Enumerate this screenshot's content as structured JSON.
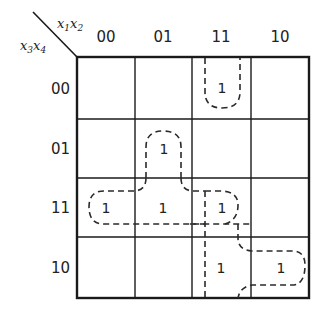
{
  "kmap": {
    "col_var": {
      "base": "x",
      "sub1": "1",
      "sub2": "2"
    },
    "row_var": {
      "base": "x",
      "sub1": "3",
      "sub2": "4"
    },
    "col_labels": [
      "00",
      "01",
      "11",
      "10"
    ],
    "row_labels": [
      "00",
      "01",
      "11",
      "10"
    ],
    "cells": [
      [
        "",
        "",
        "1",
        ""
      ],
      [
        "",
        "1",
        "",
        ""
      ],
      [
        "1",
        "1",
        "1",
        ""
      ],
      [
        "",
        "",
        "1",
        "1"
      ]
    ],
    "groupings": [
      "x1x2x3'x4' (column 11, row 00, wraps)",
      "x1'x2x4 (column 01, rows 01-11)",
      "x3x4 row 11 (columns 00-11)",
      "x1x2x3 (column 11, rows 11-10)",
      "x1x3x4' (row 10, columns 11-10)"
    ]
  }
}
